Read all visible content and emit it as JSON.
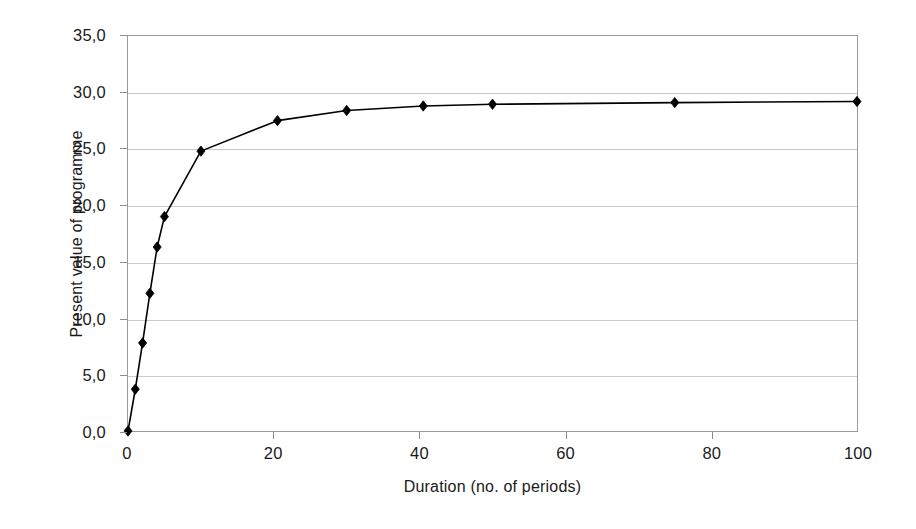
{
  "chart_data": {
    "type": "line",
    "title": "",
    "subtitle": "",
    "xlabel": "Duration (no. of periods)",
    "ylabel": "Present value of programme",
    "xlim": [
      0,
      100
    ],
    "ylim": [
      0,
      35
    ],
    "xticks": [
      "0",
      "20",
      "40",
      "60",
      "80",
      "100"
    ],
    "xtick_values": [
      0,
      20,
      40,
      60,
      80,
      100
    ],
    "yticks": [
      "0,0",
      "5,0",
      "10,0",
      "15,0",
      "20,0",
      "25,0",
      "30,0",
      "35,0"
    ],
    "ytick_values": [
      0,
      5,
      10,
      15,
      20,
      25,
      30,
      35
    ],
    "decimal_separator": ",",
    "grid": "horizontal",
    "legend": "none",
    "marker": "diamond",
    "series": [
      {
        "name": "Present value of programme",
        "color": "#000000",
        "line_color": "#000000",
        "marker_color": "#000000",
        "x": [
          0,
          1,
          2,
          3,
          4,
          5,
          10,
          20.5,
          30,
          40.5,
          50,
          75,
          100
        ],
        "values": [
          0.0,
          3.7,
          7.8,
          12.2,
          16.3,
          19.0,
          24.8,
          27.5,
          28.4,
          28.8,
          28.95,
          29.1,
          29.2
        ]
      }
    ]
  },
  "colors": {
    "background": "#ffffff",
    "plot_border": "#9a9a9a",
    "gridline": "#c9c9c9",
    "tick": "#8c8c8c",
    "text": "#1a1a1a",
    "series": "#000000"
  }
}
